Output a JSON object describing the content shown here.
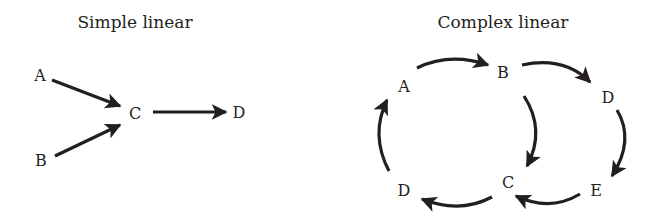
{
  "left_diagram": {
    "title": "Simple linear",
    "nodes": {
      "A": "A",
      "B": "B",
      "C": "C",
      "D": "D"
    },
    "edges": [
      [
        "A",
        "C"
      ],
      [
        "B",
        "C"
      ],
      [
        "C",
        "D"
      ]
    ]
  },
  "right_diagram": {
    "title": "Complex linear",
    "nodes": {
      "A": "A",
      "B": "B",
      "C": "C",
      "D_top": "D",
      "D_bottom": "D",
      "E": "E"
    },
    "edges": [
      [
        "A",
        "B"
      ],
      [
        "B",
        "D_top"
      ],
      [
        "B",
        "C"
      ],
      [
        "D_top",
        "E"
      ],
      [
        "E",
        "C"
      ],
      [
        "C",
        "D_bottom"
      ],
      [
        "D_bottom",
        "A"
      ]
    ]
  },
  "colors": {
    "ink": "#231f20",
    "background": "#ffffff"
  }
}
